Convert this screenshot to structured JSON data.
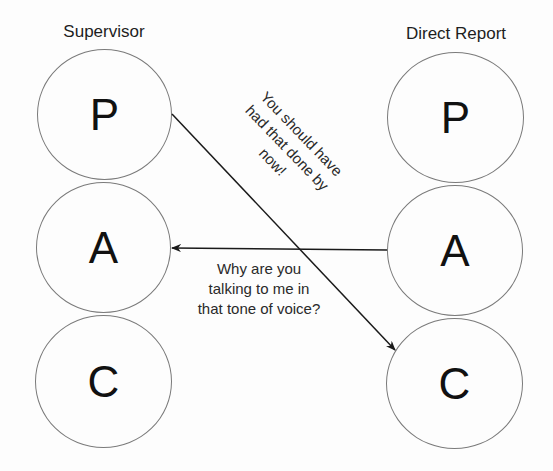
{
  "diagram": {
    "columns": [
      {
        "title": "Supervisor",
        "states": [
          {
            "letter": "P"
          },
          {
            "letter": "A"
          },
          {
            "letter": "C"
          }
        ]
      },
      {
        "title": "Direct Report",
        "states": [
          {
            "letter": "P"
          },
          {
            "letter": "A"
          },
          {
            "letter": "C"
          }
        ]
      }
    ],
    "transactions": [
      {
        "from": "Supervisor P",
        "to": "Direct Report C",
        "lines": [
          "You should have",
          "had that done by",
          "now!"
        ]
      },
      {
        "from": "Direct Report A",
        "to": "Supervisor A",
        "lines": [
          "Why are you",
          "talking to me in",
          "that tone of voice?"
        ]
      }
    ],
    "colors": {
      "background": "#fdfdfd",
      "circle_stroke": "#7a7a7a",
      "arrow": "#1a1a1a",
      "text": "#1e1e1e"
    }
  }
}
